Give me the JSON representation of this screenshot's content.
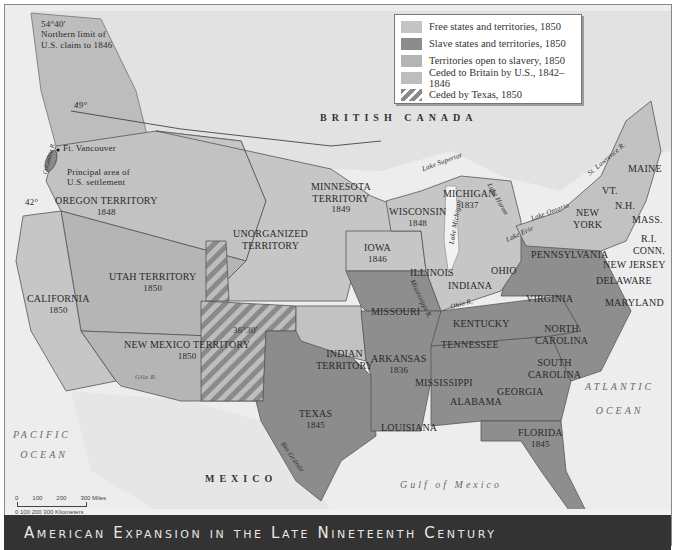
{
  "title": "American Expansion in the Late Nineteenth Century",
  "legend": {
    "items": [
      {
        "label": "Free states and territories, 1850",
        "color": "#c4c4c4",
        "pattern": "solid"
      },
      {
        "label": "Slave states and territories, 1850",
        "color": "#8c8c8c",
        "pattern": "solid"
      },
      {
        "label": "Territories open to slavery, 1850",
        "color": "#b4b4b4",
        "pattern": "solid"
      },
      {
        "label": "Ceded to Britain by U.S., 1842–1846",
        "color": "#bdbdbd",
        "pattern": "solid"
      },
      {
        "label": "Ceded by Texas, 1850",
        "color": "#8a8a8a",
        "pattern": "hatched"
      }
    ]
  },
  "annotations": {
    "northern_limit": {
      "line1": "54°40′",
      "line2": "Northern limit of",
      "line3": "U.S. claim to 1846"
    },
    "parallel_49": "49°",
    "parallel_42": "42°",
    "parallel_36": "36°30′",
    "ft_vancouver": "Ft. Vancouver",
    "settlement": {
      "line1": "Principal area of",
      "line2": "U.S. settlement"
    }
  },
  "regions": {
    "british_canada": "BRITISH CANADA",
    "mexico": "MEXICO",
    "pacific": {
      "line1": "PACIFIC",
      "line2": "OCEAN"
    },
    "atlantic": {
      "line1": "ATLANTIC",
      "line2": "OCEAN"
    },
    "gulf": "Gulf of Mexico"
  },
  "states": {
    "oregon": {
      "name": "OREGON TERRITORY",
      "year": "1848"
    },
    "minnesota": {
      "name": "MINNESOTA",
      "name2": "TERRITORY",
      "year": "1849"
    },
    "unorganized": {
      "name": "UNORGANIZED",
      "name2": "TERRITORY"
    },
    "utah": {
      "name": "UTAH TERRITORY",
      "year": "1850"
    },
    "california": {
      "name": "CALIFORNIA",
      "year": "1850"
    },
    "new_mexico": {
      "name": "NEW MEXICO TERRITORY",
      "year": "1850"
    },
    "texas": {
      "name": "TEXAS",
      "year": "1845"
    },
    "indian": {
      "name": "INDIAN",
      "name2": "TERRITORY"
    },
    "iowa": {
      "name": "IOWA",
      "year": "1846"
    },
    "wisconsin": {
      "name": "WISCONSIN",
      "year": "1848"
    },
    "michigan": {
      "name": "MICHIGAN",
      "year": "1837"
    },
    "illinois": {
      "name": "ILLINOIS"
    },
    "indiana": {
      "name": "INDIANA"
    },
    "ohio": {
      "name": "OHIO"
    },
    "missouri": {
      "name": "MISSOURI"
    },
    "kentucky": {
      "name": "KENTUCKY"
    },
    "tennessee": {
      "name": "TENNESSEE"
    },
    "arkansas": {
      "name": "ARKANSAS",
      "year": "1836"
    },
    "mississippi": {
      "name": "MISSISSIPPI"
    },
    "alabama": {
      "name": "ALABAMA"
    },
    "georgia": {
      "name": "GEORGIA"
    },
    "louisiana": {
      "name": "LOUISIANA"
    },
    "florida": {
      "name": "FLORIDA",
      "year": "1845"
    },
    "south_carolina": {
      "name": "SOUTH",
      "name2": "CAROLINA"
    },
    "north_carolina": {
      "name": "NORTH",
      "name2": "CAROLINA"
    },
    "virginia": {
      "name": "VIRGINIA"
    },
    "maryland": {
      "name": "MARYLAND"
    },
    "delaware": {
      "name": "DELAWARE"
    },
    "new_jersey": {
      "name": "NEW JERSEY"
    },
    "pennsylvania": {
      "name": "PENNSYLVANIA"
    },
    "new_york": {
      "name": "NEW",
      "name2": "YORK"
    },
    "vermont": {
      "name": "VT."
    },
    "new_hampshire": {
      "name": "N.H."
    },
    "maine": {
      "name": "MAINE"
    },
    "massachusetts": {
      "name": "MASS."
    },
    "rhode_island": {
      "name": "R.I."
    },
    "connecticut": {
      "name": "CONN."
    }
  },
  "water": {
    "lake_superior": "Lake Superior",
    "lake_michigan": "Lake Michigan",
    "lake_huron": "Lake Huron",
    "lake_erie": "Lake Erie",
    "lake_ontario": "Lake Ontario",
    "st_lawrence": "St. Lawrence R.",
    "mississippi_r": "Mississippi R.",
    "ohio_r": "Ohio R.",
    "gila_r": "Gila R.",
    "rio_grande": "Rio Grande",
    "columbia_r": "Columbia R."
  },
  "scale": {
    "miles": [
      "0",
      "100",
      "200",
      "300 Miles"
    ],
    "km": "0  100 200 300 Kilometers"
  }
}
